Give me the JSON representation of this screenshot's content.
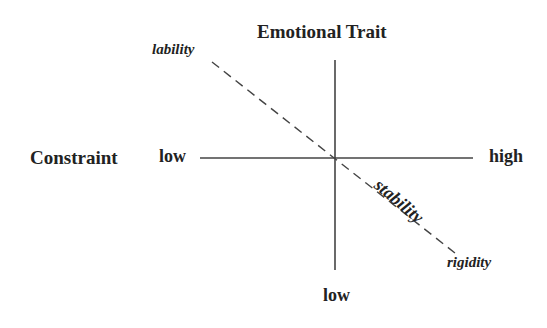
{
  "diagram": {
    "title_vertical_axis": "Emotional Trait",
    "title_horizontal_axis": "Constraint",
    "horizontal_axis": {
      "low_label": "low",
      "high_label": "high"
    },
    "vertical_axis": {
      "low_label": "low"
    },
    "diagonal": {
      "start_label": "lability",
      "middle_label": "stability",
      "end_label": "rigidity",
      "style": "dashed"
    },
    "colors": {
      "line": "#444444",
      "text": "#222222",
      "background": "#ffffff"
    }
  }
}
